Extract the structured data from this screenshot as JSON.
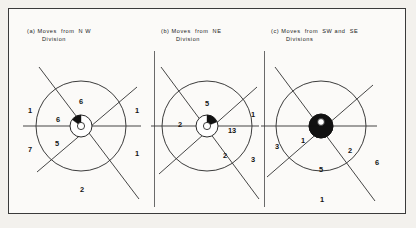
{
  "figure": {
    "background_color": "#f3f1ed",
    "frame_color": "#3a3a3a",
    "ink_color": "#141414"
  },
  "panels": [
    {
      "id": "a",
      "caption_line1": "(a) Moves  from  N W",
      "caption_line2": "Division",
      "inner_labels": [
        {
          "name": "inner-top",
          "value": "6"
        },
        {
          "name": "inner-upper-left",
          "value": "6"
        },
        {
          "name": "inner-lower-left",
          "value": "5"
        },
        {
          "name": "inner-bottom",
          "value": "2"
        }
      ],
      "outer_labels": [
        {
          "name": "outer-upper-left",
          "value": "1"
        },
        {
          "name": "outer-lower-left",
          "value": "7"
        },
        {
          "name": "outer-upper-right",
          "value": "1"
        },
        {
          "name": "outer-lower-right",
          "value": "1"
        }
      ]
    },
    {
      "id": "b",
      "caption_line1": "(b) Moves  from  NE",
      "caption_line2": "Division",
      "inner_labels": [
        {
          "name": "inner-top",
          "value": "5"
        },
        {
          "name": "inner-left",
          "value": "2"
        },
        {
          "name": "inner-right",
          "value": "13"
        },
        {
          "name": "inner-lower-right",
          "value": "2"
        }
      ],
      "outer_labels": [
        {
          "name": "outer-upper-right",
          "value": "1"
        },
        {
          "name": "outer-lower-right",
          "value": "3"
        }
      ]
    },
    {
      "id": "c",
      "caption_line1": "(c) Moves  from  SW and  SE",
      "caption_line2": "Divisions",
      "inner_labels": [
        {
          "name": "inner-left",
          "value": "1"
        },
        {
          "name": "inner-bottom",
          "value": "5"
        },
        {
          "name": "inner-right",
          "value": "2"
        }
      ],
      "outer_labels": [
        {
          "name": "outer-left",
          "value": "3"
        },
        {
          "name": "outer-bottom",
          "value": "1"
        },
        {
          "name": "outer-right",
          "value": "6"
        }
      ]
    }
  ]
}
